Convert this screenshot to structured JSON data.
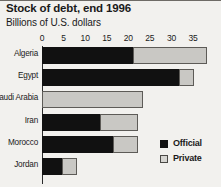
{
  "chart_data": {
    "type": "bar",
    "orientation": "horizontal",
    "stacked": true,
    "title": "Stock of debt, end 1996",
    "subtitle": "Billions of U.S. dollars",
    "xlabel": "",
    "ylabel": "",
    "xlim": [
      0,
      38.5
    ],
    "grid": false,
    "legend_position": "bottom-right",
    "ticks": [
      0,
      5,
      10,
      15,
      20,
      25,
      30,
      35
    ],
    "tick_labels": [
      "0",
      "5",
      "10",
      "15",
      "20",
      "25",
      "30",
      "35"
    ],
    "categories": [
      "Algeria",
      "Egypt",
      "Saudi Arabia",
      "Iran",
      "Morocco",
      "Jordan"
    ],
    "series": [
      {
        "name": "Official",
        "color": "#111111",
        "values": [
          21.1,
          31.8,
          0.0,
          13.5,
          16.5,
          4.6
        ]
      },
      {
        "name": "Private",
        "color": "#c9c8c4",
        "values": [
          17.2,
          3.5,
          23.4,
          8.8,
          5.8,
          3.5
        ]
      }
    ],
    "totals": [
      38.3,
      35.3,
      23.4,
      22.3,
      22.3,
      8.1
    ]
  },
  "legend": {
    "items": [
      {
        "label": "Official",
        "swatch": "official-swatch"
      },
      {
        "label": "Private",
        "swatch": "private-swatch"
      }
    ]
  }
}
